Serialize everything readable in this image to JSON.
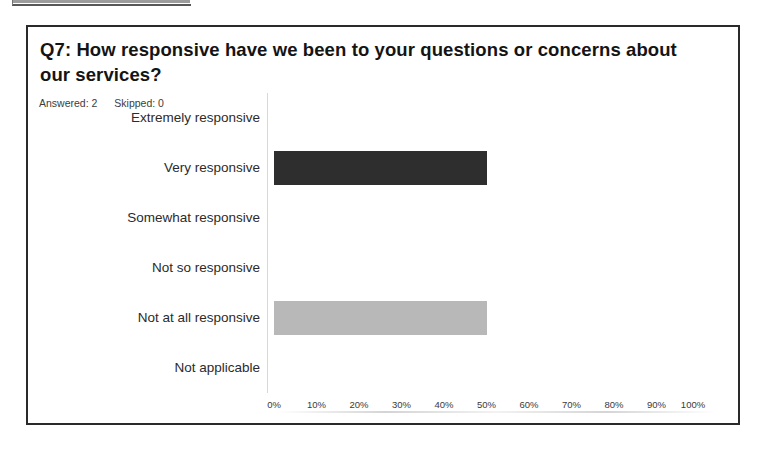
{
  "card": {
    "question_title": "Q7: How responsive have we been to your questions or concerns about our services?",
    "answered_label": "Answered: 2",
    "skipped_label": "Skipped: 0"
  },
  "chart_data": {
    "type": "bar",
    "orientation": "horizontal",
    "title": "Q7: How responsive have we been to your questions or concerns about our services?",
    "xlabel": "",
    "ylabel": "",
    "xlim": [
      0,
      100
    ],
    "grid": false,
    "legend": null,
    "categories": [
      "Extremely responsive",
      "Very responsive",
      "Somewhat responsive",
      "Not so responsive",
      "Not at all responsive",
      "Not applicable"
    ],
    "values": [
      0,
      50,
      0,
      0,
      50,
      0
    ],
    "value_unit": "%",
    "bar_colors": [
      "#2e2e2e",
      "#2e2e2e",
      "#2e2e2e",
      "#2e2e2e",
      "#b8b8b8",
      "#b8b8b8"
    ],
    "xticks": [
      "0%",
      "10%",
      "20%",
      "30%",
      "40%",
      "50%",
      "60%",
      "70%",
      "80%",
      "90%",
      "100%"
    ],
    "xtick_values": [
      0,
      10,
      20,
      30,
      40,
      50,
      60,
      70,
      80,
      90,
      100
    ],
    "respondents_answered": 2,
    "respondents_skipped": 0
  },
  "colors": {
    "bar_dark": "#2e2e2e",
    "bar_light": "#b8b8b8",
    "card_border": "#2a2a2a",
    "text": "#1a1a1a",
    "axis": "#d8d8d8"
  }
}
